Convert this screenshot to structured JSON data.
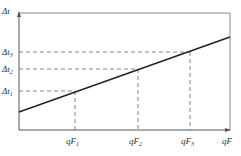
{
  "diagram": {
    "y_axis_label": "Δt",
    "x_axis_label": "qF",
    "y_ticks": [
      {
        "label": "Δt",
        "sub": "1",
        "y": 91
      },
      {
        "label": "Δt",
        "sub": "2",
        "y": 69
      },
      {
        "label": "Δt",
        "sub": "3",
        "y": 52
      }
    ],
    "x_ticks": [
      {
        "label": "qF",
        "sub": "1",
        "x": 75
      },
      {
        "label": "qF",
        "sub": "2",
        "x": 138
      },
      {
        "label": "qF",
        "sub": "3",
        "x": 190
      }
    ],
    "line": {
      "x1": 19,
      "y1": 112,
      "x2": 230,
      "y2": 37
    },
    "colors": {
      "axis": "#555555",
      "line": "#222222",
      "dash": "#666666"
    }
  }
}
